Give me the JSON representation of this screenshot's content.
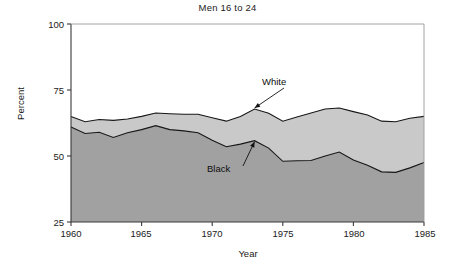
{
  "chart_data": {
    "type": "area",
    "title": "Men 16 to 24",
    "xlabel": "Year",
    "ylabel": "Percent",
    "xlim": [
      1960,
      1985
    ],
    "ylim": [
      25,
      100
    ],
    "xticks": [
      "1960",
      "1965",
      "1970",
      "1975",
      "1980",
      "1985"
    ],
    "yticks": [
      "25",
      "50",
      "75",
      "100"
    ],
    "grid": false,
    "legend_position": "inline-annotations",
    "stacked": false,
    "x": [
      1960,
      1961,
      1962,
      1963,
      1964,
      1965,
      1966,
      1967,
      1968,
      1969,
      1970,
      1971,
      1972,
      1973,
      1974,
      1975,
      1976,
      1977,
      1978,
      1979,
      1980,
      1981,
      1982,
      1983,
      1984,
      1985
    ],
    "series": [
      {
        "name": "White",
        "color": "#c9c9c9",
        "values": [
          65.0,
          63.0,
          63.8,
          63.5,
          64.0,
          65.0,
          66.3,
          66.0,
          65.8,
          65.8,
          64.5,
          63.2,
          65.0,
          67.8,
          66.2,
          63.2,
          64.8,
          66.3,
          67.8,
          68.2,
          66.8,
          65.5,
          63.2,
          63.0,
          64.3,
          65.0
        ]
      },
      {
        "name": "Black",
        "color": "#a1a1a1",
        "values": [
          61.0,
          58.5,
          59.0,
          57.0,
          58.8,
          60.0,
          61.5,
          60.0,
          59.5,
          58.8,
          56.0,
          53.5,
          54.5,
          55.8,
          53.0,
          48.0,
          48.2,
          48.3,
          50.0,
          51.5,
          48.5,
          46.5,
          44.0,
          43.8,
          45.5,
          47.5
        ]
      }
    ],
    "annotations": [
      {
        "label": "White",
        "target_year": 1973,
        "target_value": 67.8
      },
      {
        "label": "Black",
        "target_year": 1973,
        "target_value": 55.8
      }
    ]
  }
}
